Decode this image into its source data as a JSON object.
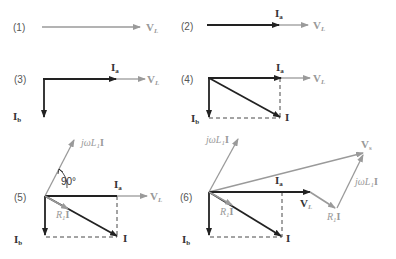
{
  "figure": {
    "panels": [
      {
        "id": "(1)",
        "vectors": [
          "V_L"
        ]
      },
      {
        "id": "(2)",
        "vectors": [
          "I_a",
          "V_L"
        ]
      },
      {
        "id": "(3)",
        "vectors": [
          "I_a",
          "V_L",
          "I_b"
        ]
      },
      {
        "id": "(4)",
        "vectors": [
          "I_a",
          "V_L",
          "I_b",
          "I"
        ]
      },
      {
        "id": "(5)",
        "vectors": [
          "jωL1I",
          "I_a",
          "V_L",
          "I_b",
          "R1I",
          "I"
        ],
        "angle": "90°"
      },
      {
        "id": "(6)",
        "vectors": [
          "jωL1I",
          "I_a",
          "V_L",
          "R1I",
          "jωL1I",
          "V_s",
          "I_b",
          "R1I",
          "I"
        ]
      }
    ],
    "labels": {
      "p1": "(1)",
      "p2": "(2)",
      "p3": "(3)",
      "p4": "(4)",
      "p5": "(5)",
      "p6": "(6)",
      "V": "V",
      "L_sub": "L",
      "I": "I",
      "a_sub": "a",
      "b_sub": "b",
      "s_sub": "s",
      "jw": "jωL",
      "one_sub": "1",
      "R": "R",
      "angle": "90°"
    },
    "colors": {
      "dark": "#222222",
      "gray": "#9a9a9a"
    }
  }
}
